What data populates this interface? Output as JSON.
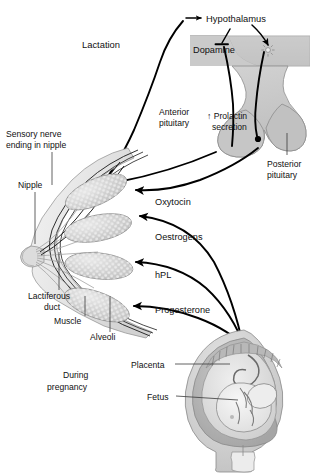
{
  "figure": {
    "title_left": "Lactation",
    "title_bottom_left": "During\npregnancy",
    "background_color": "#ffffff",
    "line_color": "#111111",
    "organ_fill": "#c8c8c8",
    "organ_fill_dark": "#a9a9a9",
    "organ_fill_light": "#dcdcdc"
  },
  "headings": {
    "lactation": "Lactation",
    "during_pregnancy_line1": "During",
    "during_pregnancy_line2": "pregnancy"
  },
  "brain": {
    "hypothalamus": "Hypothalamus",
    "dopamine": "Dopamine",
    "anterior_pituitary_line1": "Anterior",
    "anterior_pituitary_line2": "pituitary",
    "prolactin_line1": "↑ Prolactin",
    "prolactin_line2": "secretion",
    "posterior_pituitary_line1": "Posterior",
    "posterior_pituitary_line2": "pituitary"
  },
  "hormones": [
    {
      "name": "Oxytocin",
      "source": "posterior-pituitary"
    },
    {
      "name": "Oestrogens",
      "source": "placenta"
    },
    {
      "name": "hPL",
      "source": "placenta"
    },
    {
      "name": "Progesterone",
      "source": "placenta"
    }
  ],
  "breast": {
    "sensory_nerve_line1": "Sensory nerve",
    "sensory_nerve_line2": "ending in nipple",
    "nipple": "Nipple",
    "lactiferous_line1": "Lactiferous",
    "lactiferous_line2": "duct",
    "muscle": "Muscle",
    "alveoli": "Alveoli",
    "alveoli_count": 4
  },
  "uterus": {
    "placenta": "Placenta",
    "fetus": "Fetus"
  }
}
